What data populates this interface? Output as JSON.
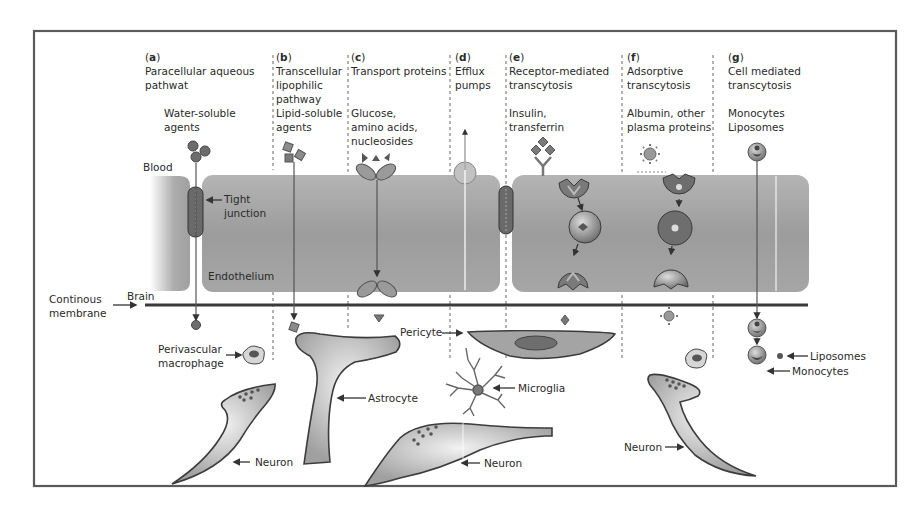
{
  "figure": {
    "frame_color": "#5a5a5a",
    "cell_color": "#a8a8a8",
    "background": "#ffffff"
  },
  "routes": [
    {
      "id": "a",
      "letter": "a",
      "title_lines": [
        "Paracellular aqueous",
        "pathwat"
      ],
      "agent_lines": [
        "Water-soluble",
        "agents"
      ]
    },
    {
      "id": "b",
      "letter": "b",
      "title_lines": [
        "Transcellular",
        "lipophilic",
        "pathway"
      ],
      "agent_lines": [
        "Lipid-soluble",
        "agents"
      ]
    },
    {
      "id": "c",
      "letter": "c",
      "title_lines": [
        "Transport proteins"
      ],
      "agent_lines": [
        "Glucose,",
        "amino acids,",
        "nucleosides"
      ]
    },
    {
      "id": "d",
      "letter": "d",
      "title_lines": [
        "Efflux",
        "pumps"
      ],
      "agent_lines": []
    },
    {
      "id": "e",
      "letter": "e",
      "title_lines": [
        "Receptor-mediated",
        "transcytosis"
      ],
      "agent_lines": [
        "Insulin,",
        "transferrin"
      ]
    },
    {
      "id": "f",
      "letter": "f",
      "title_lines": [
        "Adsorptive",
        "transcytosis"
      ],
      "agent_lines": [
        "Albumin, other",
        "plasma proteins"
      ]
    },
    {
      "id": "g",
      "letter": "g",
      "title_lines": [
        "Cell mediated",
        "transcytosis"
      ],
      "agent_lines": [
        "Monocytes",
        "Liposomes"
      ]
    }
  ],
  "labels": {
    "blood": "Blood",
    "tight_junction": [
      "Tight",
      "junction"
    ],
    "endothelium": "Endothelium",
    "brain": "Brain",
    "continuous_membrane": [
      "Continous",
      "membrane"
    ],
    "perivascular_macrophage": [
      "Perivascular",
      "macrophage"
    ],
    "astrocyte": "Astrocyte",
    "pericyte": "Pericyte",
    "microglia": "Microglia",
    "neuron_left": "Neuron",
    "neuron_center": "Neuron",
    "neuron_right": "Neuron",
    "liposomes": "Liposomes",
    "monocytes": "Monocytes"
  }
}
